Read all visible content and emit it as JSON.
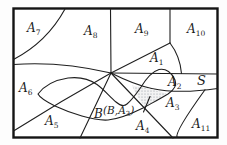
{
  "figure": {
    "type": "set-partition-diagram",
    "colors": {
      "line": "#1f1f1f",
      "background": "#ffffff",
      "stipple_dots": "#8d939b"
    },
    "sample_space": {
      "label": "S"
    },
    "event_b": {
      "label": "B"
    },
    "intersection": {
      "prefix": "(B,A",
      "sub": "3",
      "suffix": ")"
    },
    "regions": {
      "a1": {
        "base": "A",
        "sub": "1"
      },
      "a2": {
        "base": "A",
        "sub": "2"
      },
      "a3": {
        "base": "A",
        "sub": "3"
      },
      "a4": {
        "base": "A",
        "sub": "4"
      },
      "a5": {
        "base": "A",
        "sub": "5"
      },
      "a6": {
        "base": "A",
        "sub": "6"
      },
      "a7": {
        "base": "A",
        "sub": "7"
      },
      "a8": {
        "base": "A",
        "sub": "8"
      },
      "a9": {
        "base": "A",
        "sub": "9"
      },
      "a10": {
        "base": "A",
        "sub": "10"
      },
      "a11": {
        "base": "A",
        "sub": "11"
      }
    }
  }
}
